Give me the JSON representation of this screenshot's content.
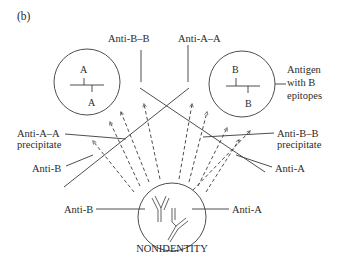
{
  "figure": {
    "panel_label": "(b)",
    "caption": "NONIDENTITY",
    "antigen_left": {
      "epitope_top": "A",
      "epitope_bottom": "A"
    },
    "antigen_right": {
      "epitope_top": "B",
      "epitope_bottom": "B",
      "label_lines": [
        "Antigen",
        "with B",
        "epitopes"
      ]
    },
    "labels": {
      "anti_b_b": "Anti-B–B",
      "anti_a_a": "Anti-A–A",
      "anti_a_a_precipitate_line1": "Anti-A–A",
      "anti_a_a_precipitate_line2": "precipitate",
      "anti_b_b_precipitate_line1": "Anti-B–B",
      "anti_b_b_precipitate_line2": "precipitate",
      "anti_b_left": "Anti-B",
      "anti_a_right": "Anti-A",
      "anti_b_well": "Anti-B",
      "anti_a_well": "Anti-A"
    }
  }
}
